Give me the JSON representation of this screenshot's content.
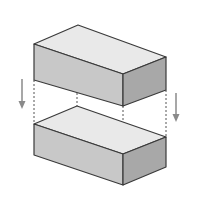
{
  "diagram": {
    "title": "",
    "colors": {
      "background": "#ffffff",
      "top_face": "#e9e9e9",
      "front_face": "#c8c8c8",
      "side_face": "#a8a8a8",
      "edge": "#3a3a3a",
      "dashed": "#555555",
      "arrow": "#8a8a8a"
    },
    "shapes": [
      {
        "name": "upper-box",
        "type": "rectangular-prism"
      },
      {
        "name": "lower-box",
        "type": "rectangular-prism"
      }
    ],
    "arrows": [
      {
        "name": "left-down-arrow",
        "direction": "down"
      },
      {
        "name": "right-down-arrow",
        "direction": "down"
      }
    ]
  }
}
